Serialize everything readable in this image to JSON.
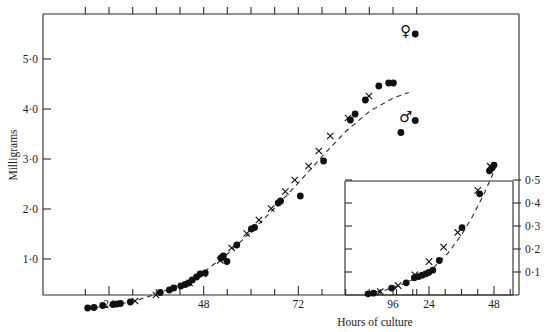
{
  "chart_data": {
    "type": "scatter",
    "title": "",
    "xlabel": "Hours of culture",
    "ylabel": "Milligrams",
    "xlim": [
      12,
      104
    ],
    "ylim": [
      0,
      5.8
    ],
    "grid": false,
    "legend_position": "inside-right",
    "x_ticks_labeled": [
      "24",
      "48",
      "72",
      "96"
    ],
    "x_tick_values": [
      24,
      48,
      72,
      96
    ],
    "y_ticks_labeled": [
      "1·0",
      "2·0",
      "3·0",
      "4·0",
      "5·0"
    ],
    "y_tick_values": [
      1.0,
      2.0,
      3.0,
      4.0,
      5.0
    ],
    "annotations": [
      {
        "symbol": "♀",
        "marker": "filled-circle",
        "x": 100.5,
        "y": 5.55,
        "label": "female"
      },
      {
        "symbol": "♂",
        "marker": "filled-circle",
        "x": 100.5,
        "y": 3.82,
        "label": "male"
      }
    ],
    "series": [
      {
        "name": "filled-circle",
        "marker": "●",
        "color": "#111111",
        "points": [
          [
            18.6,
            0.02
          ],
          [
            20.2,
            0.03
          ],
          [
            22.4,
            0.07
          ],
          [
            25.0,
            0.09
          ],
          [
            26.0,
            0.1
          ],
          [
            26.9,
            0.11
          ],
          [
            29.4,
            0.14
          ],
          [
            37.0,
            0.33
          ],
          [
            39.3,
            0.38
          ],
          [
            40.4,
            0.42
          ],
          [
            42.2,
            0.46
          ],
          [
            43.3,
            0.49
          ],
          [
            44.2,
            0.52
          ],
          [
            45.1,
            0.58
          ],
          [
            46.2,
            0.64
          ],
          [
            47.1,
            0.7
          ],
          [
            48.4,
            0.72
          ],
          [
            52.4,
            1.02
          ],
          [
            53.0,
            1.06
          ],
          [
            53.9,
            0.95
          ],
          [
            56.4,
            1.28
          ],
          [
            60.1,
            1.6
          ],
          [
            60.9,
            1.63
          ],
          [
            66.9,
            2.12
          ],
          [
            67.5,
            2.16
          ],
          [
            72.5,
            2.26
          ],
          [
            78.4,
            2.96
          ],
          [
            85.2,
            3.78
          ],
          [
            86.4,
            3.9
          ],
          [
            89.0,
            4.18
          ],
          [
            92.4,
            4.46
          ],
          [
            94.9,
            4.52
          ],
          [
            96.1,
            4.52
          ],
          [
            98.0,
            3.53
          ]
        ]
      },
      {
        "name": "cross",
        "marker": "×",
        "color": "#111111",
        "points": [
          [
            30.6,
            0.16
          ],
          [
            35.9,
            0.28
          ],
          [
            44.4,
            0.52
          ],
          [
            47.9,
            0.7
          ],
          [
            52.2,
            0.97
          ],
          [
            55.1,
            1.22
          ],
          [
            58.9,
            1.51
          ],
          [
            62.0,
            1.78
          ],
          [
            65.1,
            2.01
          ],
          [
            68.7,
            2.35
          ],
          [
            71.1,
            2.58
          ],
          [
            74.6,
            2.86
          ],
          [
            77.2,
            3.16
          ],
          [
            80.1,
            3.46
          ],
          [
            84.6,
            3.82
          ],
          [
            89.9,
            4.26
          ]
        ]
      },
      {
        "name": "fitted-curve",
        "marker": "dashed-line",
        "color": "#2a2a2a",
        "points": [
          [
            18.0,
            0.01
          ],
          [
            24.0,
            0.06
          ],
          [
            30.0,
            0.15
          ],
          [
            36.0,
            0.3
          ],
          [
            42.0,
            0.48
          ],
          [
            48.0,
            0.74
          ],
          [
            54.0,
            1.1
          ],
          [
            60.0,
            1.54
          ],
          [
            66.0,
            2.02
          ],
          [
            72.0,
            2.52
          ],
          [
            78.0,
            3.05
          ],
          [
            84.0,
            3.55
          ],
          [
            90.0,
            3.95
          ],
          [
            96.0,
            4.22
          ],
          [
            100.0,
            4.33
          ]
        ]
      }
    ],
    "inset": {
      "type": "scatter",
      "xlabel": "",
      "ylabel": "",
      "xlim": [
        0,
        54
      ],
      "ylim": [
        0,
        0.58
      ],
      "x_ticks_labeled": [
        "24",
        "48"
      ],
      "x_tick_values": [
        24,
        48
      ],
      "y_axis_side": "right",
      "y_ticks_labeled": [
        "0·1",
        "0·2",
        "0·3",
        "0·4",
        "0·5"
      ],
      "y_tick_values": [
        0.1,
        0.2,
        0.3,
        0.4,
        0.5
      ],
      "left_axis_unlabeled_ticks": 5,
      "series": [
        {
          "name": "filled-circle",
          "marker": "●",
          "color": "#111111",
          "points": [
            [
              1.5,
              0.005
            ],
            [
              3.5,
              0.008
            ],
            [
              10.2,
              0.03
            ],
            [
              15.6,
              0.053
            ],
            [
              18.6,
              0.075
            ],
            [
              20.2,
              0.08
            ],
            [
              21.5,
              0.086
            ],
            [
              22.8,
              0.092
            ],
            [
              23.9,
              0.098
            ],
            [
              25.4,
              0.108
            ],
            [
              27.8,
              0.15
            ],
            [
              36.2,
              0.293
            ],
            [
              42.7,
              0.44
            ],
            [
              46.3,
              0.54
            ],
            [
              47.2,
              0.552
            ],
            [
              48.0,
              0.565
            ]
          ]
        },
        {
          "name": "cross",
          "marker": "×",
          "color": "#111111",
          "points": [
            [
              6.0,
              0.015
            ],
            [
              12.6,
              0.041
            ],
            [
              18.8,
              0.088
            ],
            [
              24.0,
              0.145
            ],
            [
              29.4,
              0.208
            ],
            [
              34.6,
              0.272
            ],
            [
              42.0,
              0.455
            ],
            [
              46.6,
              0.56
            ]
          ]
        },
        {
          "name": "fitted-curve",
          "marker": "dashed-line",
          "color": "#2a2a2a",
          "points": [
            [
              1.0,
              0.004
            ],
            [
              8.0,
              0.022
            ],
            [
              14.0,
              0.046
            ],
            [
              20.0,
              0.078
            ],
            [
              26.0,
              0.122
            ],
            [
              31.0,
              0.182
            ],
            [
              36.0,
              0.262
            ],
            [
              40.0,
              0.34
            ],
            [
              44.0,
              0.432
            ],
            [
              47.0,
              0.51
            ],
            [
              49.0,
              0.568
            ]
          ]
        }
      ]
    }
  },
  "axes": {
    "y_title": "Milligrams",
    "x_title": "Hours of culture"
  }
}
